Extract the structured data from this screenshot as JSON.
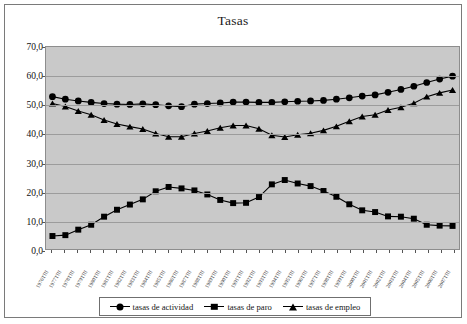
{
  "chart_data": {
    "type": "line",
    "title": "Tasas",
    "xlabel": "",
    "ylabel": "",
    "ylim": [
      0,
      70
    ],
    "ytick_step": 10,
    "ytick_labels": [
      "0,0",
      "10,0",
      "20,0",
      "30,0",
      "40,0",
      "50,0",
      "60,0",
      "70,0"
    ],
    "grid": true,
    "legend_position": "bottom",
    "marker_color": "#000000",
    "plot_background": "#c9c9c9",
    "categories": [
      "1976TIII",
      "1977TIII",
      "1978TIII",
      "1979TIII",
      "1980TIII",
      "1981TIII",
      "1982TIII",
      "1983TIII",
      "1984TIII",
      "1985TIII",
      "1986TIII",
      "1987TIII",
      "1988TIII",
      "1989TIII",
      "1990TIII",
      "1991TIII",
      "1992TIII",
      "1993TIII",
      "1994TIII",
      "1995TIII",
      "1996TIII",
      "1997TIII",
      "1998TIII",
      "1999TIII",
      "2000TIII",
      "2001TIII",
      "2002TIII",
      "2003TIII",
      "2004TIII",
      "2005TIII",
      "2006TIII",
      "2007TIII"
    ],
    "series": [
      {
        "name": "tasas de actividad",
        "marker": "circle",
        "values": [
          52.8,
          51.9,
          51.3,
          50.8,
          50.4,
          50.2,
          50.1,
          50.3,
          50.0,
          49.6,
          49.3,
          50.2,
          50.4,
          50.6,
          50.9,
          50.9,
          50.8,
          50.8,
          51.0,
          51.2,
          51.3,
          51.5,
          51.9,
          52.4,
          53.0,
          53.4,
          54.3,
          55.3,
          56.4,
          57.7,
          58.9,
          59.9
        ]
      },
      {
        "name": "tasas de paro",
        "marker": "square",
        "values": [
          4.5,
          4.8,
          6.7,
          8.4,
          11.2,
          13.6,
          15.4,
          17.2,
          20.0,
          21.5,
          21.0,
          20.3,
          18.9,
          17.0,
          15.9,
          16.0,
          18.0,
          22.4,
          23.9,
          22.7,
          21.8,
          20.1,
          18.1,
          15.5,
          13.4,
          12.8,
          11.3,
          11.2,
          10.5,
          8.4,
          8.1,
          8.0
        ]
      },
      {
        "name": "tasas de empleo",
        "marker": "triangle",
        "values": [
          50.4,
          49.4,
          47.8,
          46.5,
          44.7,
          43.3,
          42.4,
          41.6,
          40.0,
          38.9,
          38.9,
          40.0,
          40.9,
          42.0,
          42.8,
          42.8,
          41.7,
          39.4,
          38.8,
          39.6,
          40.1,
          41.1,
          42.5,
          44.3,
          45.9,
          46.5,
          48.2,
          49.1,
          50.5,
          52.8,
          54.1,
          55.1
        ]
      }
    ]
  },
  "legend": {
    "items": [
      {
        "label": "tasas de actividad",
        "marker": "circle"
      },
      {
        "label": "tasas de paro",
        "marker": "square"
      },
      {
        "label": "tasas de empleo",
        "marker": "triangle"
      }
    ]
  }
}
